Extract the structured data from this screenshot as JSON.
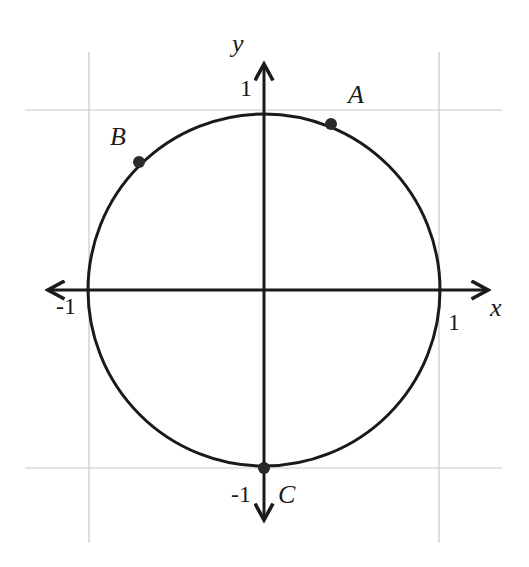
{
  "diagram": {
    "axes": {
      "x_label": "x",
      "y_label": "y",
      "tick_labels": {
        "x_pos": "1",
        "x_neg": "-1",
        "y_pos": "1",
        "y_neg": "-1"
      }
    },
    "points": [
      {
        "name": "A",
        "angle_deg": 67
      },
      {
        "name": "B",
        "angle_deg": 135
      },
      {
        "name": "C",
        "angle_deg": 270
      }
    ],
    "colors": {
      "stroke": "#1a1a1a",
      "grid": "#c8c8c8",
      "point": "#2a2a2a"
    }
  }
}
